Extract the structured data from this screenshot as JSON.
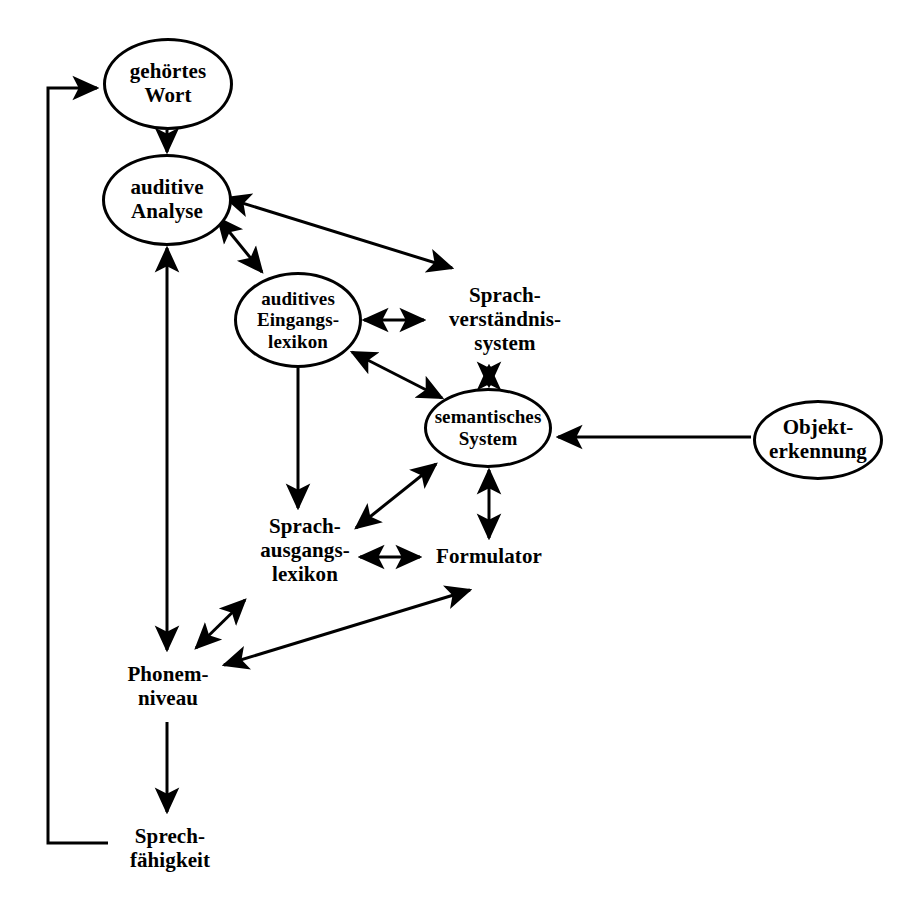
{
  "diagram": {
    "language": "de",
    "background_color": "#ffffff",
    "stroke_color": "#000000",
    "nodes": [
      {
        "id": "gehoertes-wort",
        "label": "gehörtes\nWort",
        "shape": "ellipse",
        "x": 103,
        "y": 38,
        "w": 130,
        "h": 92
      },
      {
        "id": "auditive-analyse",
        "label": "auditive\nAnalyse",
        "shape": "ellipse",
        "x": 102,
        "y": 154,
        "w": 130,
        "h": 92
      },
      {
        "id": "auditives-eingangslexikon",
        "label": "auditives\nEingangs-\nlexikon",
        "shape": "ellipse",
        "x": 234,
        "y": 272,
        "w": 128,
        "h": 96
      },
      {
        "id": "sprachverstaendnissystem",
        "label": "Sprach-\nverständnis-\nsystem",
        "shape": "text",
        "x": 420,
        "y": 274,
        "w": 170,
        "h": 92
      },
      {
        "id": "semantisches-system",
        "label": "semantisches\nSystem",
        "shape": "ellipse",
        "x": 424,
        "y": 388,
        "w": 128,
        "h": 80
      },
      {
        "id": "objekterkennung",
        "label": "Objekt-\nerkennung",
        "shape": "ellipse",
        "x": 753,
        "y": 400,
        "w": 130,
        "h": 80
      },
      {
        "id": "sprachausgangslexikon",
        "label": "Sprach-\nausgangs-\nlexikon",
        "shape": "text",
        "x": 240,
        "y": 505,
        "w": 130,
        "h": 92
      },
      {
        "id": "formulator",
        "label": "Formulator",
        "shape": "text",
        "x": 424,
        "y": 542,
        "w": 130,
        "h": 30
      },
      {
        "id": "phonemniveau",
        "label": "Phonem-\nniveau",
        "shape": "text",
        "x": 106,
        "y": 656,
        "w": 124,
        "h": 62
      },
      {
        "id": "sprechfaehigkeit",
        "label": "Sprech-\nfähigkeit",
        "shape": "text",
        "x": 110,
        "y": 818,
        "w": 120,
        "h": 62
      }
    ],
    "edges": [
      {
        "id": "feedback-to-gehoertes-wort",
        "from": "sprechfaehigkeit",
        "to": "gehoertes-wort",
        "kind": "orthogonal",
        "arrows": "end"
      },
      {
        "id": "gehoertes-wort-to-auditive-analyse",
        "from": "gehoertes-wort",
        "to": "auditive-analyse",
        "kind": "straight",
        "arrows": "end"
      },
      {
        "id": "auditive-analyse-to-eingangslexikon",
        "from": "auditive-analyse",
        "to": "auditives-eingangslexikon",
        "kind": "straight",
        "arrows": "both"
      },
      {
        "id": "auditive-analyse-to-sprachverstaendnissystem",
        "from": "auditive-analyse",
        "to": "sprachverstaendnissystem",
        "kind": "straight",
        "arrows": "both"
      },
      {
        "id": "eingangslexikon-to-sprachverstaendnissystem",
        "from": "auditives-eingangslexikon",
        "to": "sprachverstaendnissystem",
        "kind": "straight",
        "arrows": "both"
      },
      {
        "id": "eingangslexikon-to-semantisches-system",
        "from": "auditives-eingangslexikon",
        "to": "semantisches-system",
        "kind": "straight",
        "arrows": "both"
      },
      {
        "id": "eingangslexikon-to-sprachausgangslexikon",
        "from": "auditives-eingangslexikon",
        "to": "sprachausgangslexikon",
        "kind": "straight",
        "arrows": "end"
      },
      {
        "id": "semantisches-system-to-sprachverstaendnissystem",
        "from": "semantisches-system",
        "to": "sprachverstaendnissystem",
        "kind": "straight",
        "arrows": "both"
      },
      {
        "id": "objekterkennung-to-semantisches-system",
        "from": "objekterkennung",
        "to": "semantisches-system",
        "kind": "straight",
        "arrows": "end"
      },
      {
        "id": "semantisches-system-to-sprachausgangslexikon",
        "from": "semantisches-system",
        "to": "sprachausgangslexikon",
        "kind": "straight",
        "arrows": "both"
      },
      {
        "id": "semantisches-system-to-formulator",
        "from": "semantisches-system",
        "to": "formulator",
        "kind": "straight",
        "arrows": "both"
      },
      {
        "id": "sprachausgangslexikon-to-formulator",
        "from": "sprachausgangslexikon",
        "to": "formulator",
        "kind": "straight",
        "arrows": "both"
      },
      {
        "id": "auditive-analyse-to-phonemniveau",
        "from": "auditive-analyse",
        "to": "phonemniveau",
        "kind": "straight",
        "arrows": "both"
      },
      {
        "id": "phonemniveau-to-sprachausgangslexikon",
        "from": "phonemniveau",
        "to": "sprachausgangslexikon",
        "kind": "straight",
        "arrows": "both"
      },
      {
        "id": "phonemniveau-to-formulator",
        "from": "phonemniveau",
        "to": "formulator",
        "kind": "straight",
        "arrows": "both"
      },
      {
        "id": "phonemniveau-to-sprechfaehigkeit",
        "from": "phonemniveau",
        "to": "sprechfaehigkeit",
        "kind": "straight",
        "arrows": "end"
      }
    ]
  }
}
